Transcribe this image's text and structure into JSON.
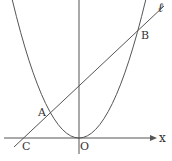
{
  "figure": {
    "type": "graph of parabola and line",
    "curve": "parabola with vertex at origin O",
    "line_label": "ℓ",
    "axis_label_x": "x",
    "points": [
      {
        "label": "A",
        "note": "left intersection of line ℓ and parabola"
      },
      {
        "label": "B",
        "note": "right intersection of line ℓ and parabola"
      },
      {
        "label": "C",
        "note": "intersection of line ℓ and x-axis"
      },
      {
        "label": "O",
        "note": "origin"
      }
    ]
  },
  "labels": {
    "A": "A",
    "B": "B",
    "C": "C",
    "O": "O",
    "x": "x",
    "l": "ℓ"
  },
  "colors": {
    "stroke": "#555555",
    "text": "#333333",
    "background": "#ffffff"
  }
}
